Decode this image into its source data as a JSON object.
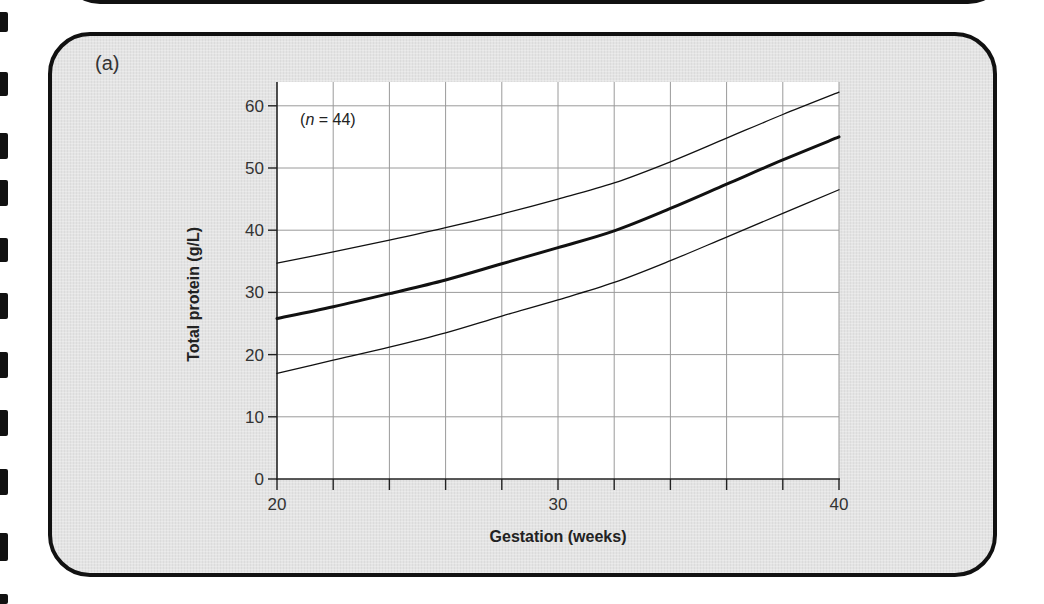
{
  "panel": {
    "label": "(a)"
  },
  "colors": {
    "panel_bg": "#e4e4e4",
    "plot_bg": "#ffffff",
    "grid": "#9a9a9a",
    "line": "#111111",
    "border": "#111111"
  },
  "chart_data": {
    "type": "line",
    "title": "",
    "panel_label": "(a)",
    "xlabel": "Gestation (weeks)",
    "ylabel": "Total protein (g/L)",
    "xlim": [
      20,
      40
    ],
    "ylim": [
      0,
      63
    ],
    "xticks": [
      20,
      22,
      24,
      26,
      28,
      30,
      32,
      34,
      36,
      38,
      40
    ],
    "xtick_labels": [
      "20",
      "",
      "",
      "",
      "",
      "30",
      "",
      "",
      "",
      "",
      "40"
    ],
    "yticks": [
      0,
      10,
      20,
      30,
      40,
      50,
      60
    ],
    "ytick_labels": [
      "0",
      "10",
      "20",
      "30",
      "40",
      "50",
      "60"
    ],
    "grid": true,
    "annotations": [
      {
        "text_prefix": "(",
        "italic": "n",
        "text_suffix": " = 44)",
        "x": 21,
        "y": 57
      }
    ],
    "x": [
      20,
      22,
      24,
      26,
      28,
      30,
      32,
      34,
      36,
      38,
      40
    ],
    "series": [
      {
        "name": "Upper reference limit",
        "style": "thin",
        "values": [
          34.7,
          36.5,
          38.4,
          40.4,
          42.6,
          45.0,
          47.6,
          51.0,
          54.8,
          58.6,
          62.2
        ]
      },
      {
        "name": "Mean",
        "style": "thick",
        "values": [
          25.8,
          27.7,
          29.8,
          32.0,
          34.6,
          37.2,
          39.9,
          43.5,
          47.4,
          51.3,
          55.0
        ]
      },
      {
        "name": "Lower reference limit",
        "style": "thin",
        "values": [
          17.0,
          19.1,
          21.2,
          23.5,
          26.2,
          28.8,
          31.6,
          35.1,
          38.9,
          42.7,
          46.5
        ]
      }
    ]
  }
}
